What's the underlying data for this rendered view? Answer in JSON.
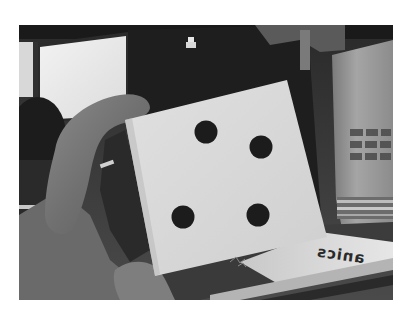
{
  "image": {
    "type": "photograph",
    "mode": "grayscale",
    "frame": {
      "x": 19,
      "y": 25,
      "width": 374,
      "height": 275
    },
    "subject": "hand holding a white square card with four black dots",
    "card": {
      "corners": {
        "top_left": [
          125,
          120
        ],
        "top_right": [
          287,
          80
        ],
        "bottom_right": [
          327,
          237
        ],
        "bottom_left": [
          155,
          276
        ]
      },
      "color": "#d9d9d9",
      "dots": [
        {
          "name": "top-left-dot",
          "cx": 206,
          "cy": 132,
          "r": 11
        },
        {
          "name": "top-right-dot",
          "cx": 261,
          "cy": 147,
          "r": 11
        },
        {
          "name": "bottom-left-dot",
          "cx": 183,
          "cy": 217,
          "r": 11
        },
        {
          "name": "bottom-right-dot",
          "cx": 258,
          "cy": 215,
          "r": 11
        }
      ],
      "dot_color": "#1c1c1c"
    },
    "background_objects": {
      "left_monitor": "bright window/screen at top-left",
      "dark_box": "dark object behind card with small light logo",
      "right_can": "tall cylindrical container with blurred printed text",
      "book": "book lying at bottom right"
    },
    "book_text": "anics",
    "colors": {
      "page_background": "#ffffff",
      "card": "#d9d9d9",
      "dots": "#1c1c1c",
      "dark_box": "#1e1e1e",
      "monitor_screen": "#e8e8e8",
      "skin": "#7a7a7a",
      "can": "#9a9a9a"
    }
  }
}
